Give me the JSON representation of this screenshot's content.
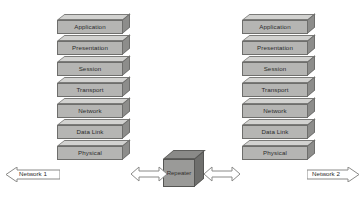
{
  "diagram": {
    "background_color": "#ffffff",
    "box_face_color": "#b5b5b3",
    "box_top_color": "#d2d2d0",
    "box_side_color": "#8d8d8b",
    "box_outline_color": "#6e6e6c",
    "repeater_face_color": "#9a9a98",
    "arrow_fill_color": "#ffffff",
    "arrow_outline_color": "#8a8a88"
  },
  "left_stack": {
    "name": "Left OSI protocol stack",
    "layers": [
      {
        "label": "Application"
      },
      {
        "label": "Presentation"
      },
      {
        "label": "Session"
      },
      {
        "label": "Transport"
      },
      {
        "label": "Network"
      },
      {
        "label": "Data Link"
      },
      {
        "label": "Physical"
      }
    ]
  },
  "right_stack": {
    "name": "Right OSI protocol stack",
    "layers": [
      {
        "label": "Application"
      },
      {
        "label": "Presentation"
      },
      {
        "label": "Session"
      },
      {
        "label": "Transport"
      },
      {
        "label": "Network"
      },
      {
        "label": "Data Link"
      },
      {
        "label": "Physical"
      }
    ]
  },
  "repeater": {
    "label": "Repeater"
  },
  "networks": {
    "left": {
      "label": "Network 1"
    },
    "right": {
      "label": "Network 2"
    }
  },
  "connectors": {
    "left_link": {
      "name": "left-physical-to-repeater-arrow"
    },
    "right_link": {
      "name": "repeater-to-right-physical-arrow"
    }
  }
}
